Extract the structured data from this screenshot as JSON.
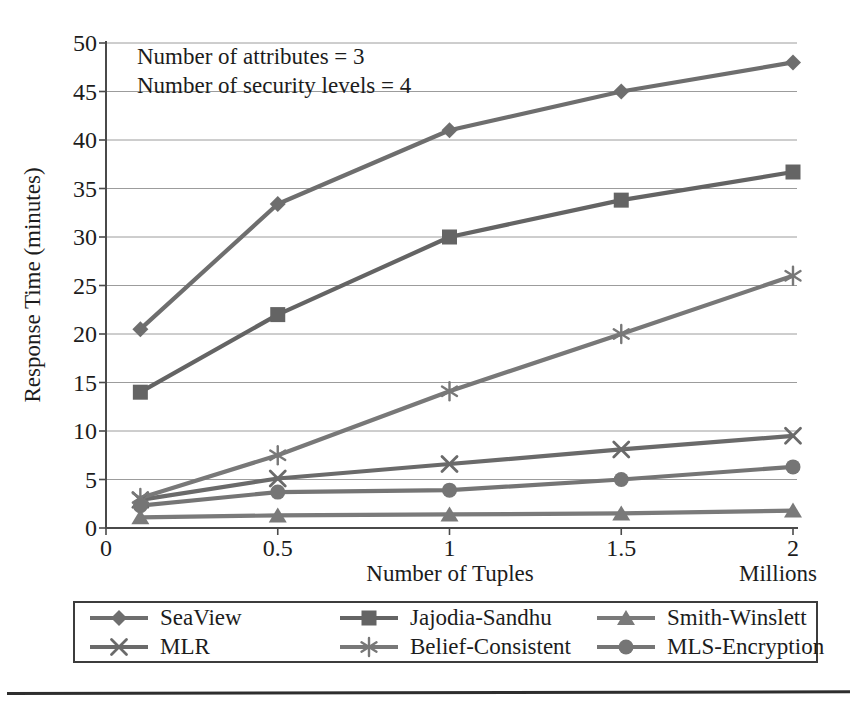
{
  "figure": {
    "kind": "scanned book figure, grayscale line chart",
    "background": "#ffffff",
    "text_color": "#1c1c1c",
    "bottom_rule_color": "#2e2e2e",
    "annotation_line1": "Number of attributes = 3",
    "annotation_line2": "Number of security levels = 4",
    "x_unit_label": "Millions"
  },
  "chart_data": {
    "type": "line",
    "title": "",
    "xlabel": "Number of Tuples",
    "ylabel": "Response Time (minutes)",
    "x_unit": "Millions",
    "xlim": [
      0,
      2
    ],
    "ylim": [
      0,
      50
    ],
    "x_ticks": [
      0,
      0.5,
      1,
      1.5,
      2
    ],
    "x_tick_labels": [
      "0",
      "0.5",
      "1",
      "1.5",
      "2"
    ],
    "y_ticks": [
      0,
      5,
      10,
      15,
      20,
      25,
      30,
      35,
      40,
      45,
      50
    ],
    "grid": "horizontal gridlines every 5 units",
    "legend_position": "boxed legend below chart, 2 rows x 3 columns",
    "annotations": [
      "Number of attributes = 3",
      "Number of security levels = 4"
    ],
    "x": [
      0.1,
      0.5,
      1,
      1.5,
      2
    ],
    "series": [
      {
        "name": "SeaView",
        "marker": "diamond",
        "color": "#6e6e6e",
        "values": [
          20.5,
          33.4,
          41.0,
          45.0,
          48.0
        ]
      },
      {
        "name": "Jajodia-Sandhu",
        "marker": "square",
        "color": "#646464",
        "values": [
          14.0,
          22.0,
          30.0,
          33.8,
          36.7
        ]
      },
      {
        "name": "Smith-Winslett",
        "marker": "triangle",
        "color": "#7a7a7a",
        "values": [
          1.1,
          1.3,
          1.4,
          1.5,
          1.8
        ]
      },
      {
        "name": "MLR",
        "marker": "x",
        "color": "#6a6a6a",
        "values": [
          2.9,
          5.1,
          6.6,
          8.1,
          9.5
        ]
      },
      {
        "name": "Belief-Consistent",
        "marker": "asterisk",
        "color": "#787878",
        "values": [
          3.1,
          7.5,
          14.1,
          20.0,
          26.0
        ]
      },
      {
        "name": "MLS-Encryption",
        "marker": "circle",
        "color": "#757575",
        "values": [
          2.3,
          3.7,
          3.9,
          5.0,
          6.3
        ]
      }
    ],
    "style": {
      "gridline_color": "#9c9c9c",
      "axis_color": "#4a4a4a",
      "line_width": 4.2
    }
  }
}
